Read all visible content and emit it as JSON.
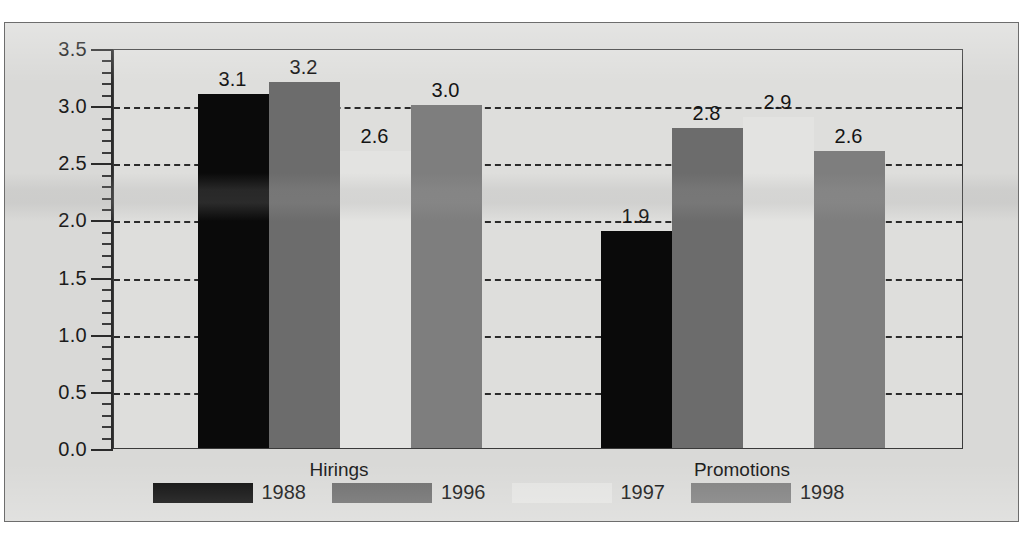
{
  "chart_data": {
    "type": "bar",
    "title": "",
    "xlabel": "",
    "ylabel": "",
    "categories": [
      "Hirings",
      "Promotions"
    ],
    "series": [
      {
        "name": "1988",
        "color": "#0a0a0a",
        "values": [
          3.1,
          1.9
        ]
      },
      {
        "name": "1996",
        "color": "#6c6c6c",
        "values": [
          3.2,
          2.8
        ]
      },
      {
        "name": "1997",
        "color": "#e3e3e1",
        "values": [
          2.6,
          2.9
        ]
      },
      {
        "name": "1998",
        "color": "#7e7e7e",
        "values": [
          3.0,
          2.6
        ]
      }
    ],
    "ylim": [
      0.0,
      3.5
    ],
    "ytick_step": 0.5,
    "yticks": [
      "0.0",
      "0.5",
      "1.0",
      "1.5",
      "2.0",
      "2.5",
      "3.0",
      "3.5"
    ],
    "minor_tick_step": 0.1,
    "grid": true,
    "grid_style": "dashed",
    "legend_position": "bottom",
    "value_labels": [
      {
        "group": "Hirings",
        "series": "1988",
        "text": "3.1"
      },
      {
        "group": "Hirings",
        "series": "1996",
        "text": "3.2"
      },
      {
        "group": "Hirings",
        "series": "1997",
        "text": "2.6"
      },
      {
        "group": "Hirings",
        "series": "1998",
        "text": "3.0"
      },
      {
        "group": "Promotions",
        "series": "1988",
        "text": "1.9"
      },
      {
        "group": "Promotions",
        "series": "1996",
        "text": "2.8"
      },
      {
        "group": "Promotions",
        "series": "1997",
        "text": "2.9"
      },
      {
        "group": "Promotions",
        "series": "1998",
        "text": "2.6"
      }
    ]
  },
  "colors": {
    "panel_background": "#d9d9d7",
    "plot_background": "#dededc",
    "axis": "#2b2b2b",
    "text": "#141414"
  }
}
